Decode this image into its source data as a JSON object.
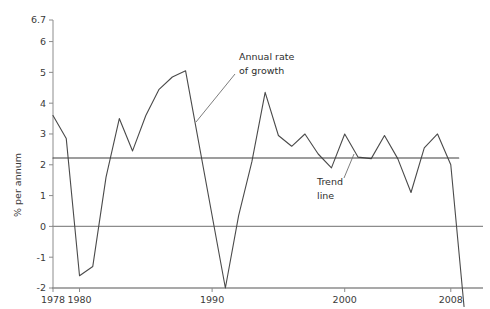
{
  "chart_data": {
    "type": "line",
    "title": "",
    "xlabel": "",
    "ylabel": "% per annum",
    "xlim": [
      1978,
      2009.6
    ],
    "ylim": [
      -2,
      6.7
    ],
    "grid": false,
    "legend_position": "none",
    "x_ticks": [
      "1978",
      "1980",
      "1990",
      "2000",
      "2008"
    ],
    "x_tick_values": [
      1978,
      1980,
      1990,
      2000,
      2008
    ],
    "y_ticks": [
      "-2",
      "-1",
      "0",
      "1",
      "2",
      "3",
      "4",
      "5",
      "6",
      "6.7"
    ],
    "y_tick_values": [
      -2,
      -1,
      0,
      1,
      2,
      3,
      4,
      5,
      6,
      6.7
    ],
    "reference_lines": [
      {
        "name": "zero-line",
        "value": 0,
        "color": "#8c8c8c"
      },
      {
        "name": "axis-baseline",
        "value": -2,
        "color": "#8c8c8c"
      }
    ],
    "series": [
      {
        "name": "Annual rate of growth",
        "color": "#4a4a4a",
        "x": [
          1978,
          1979,
          1980,
          1981,
          1982,
          1983,
          1984,
          1985,
          1986,
          1987,
          1988,
          1991,
          1992,
          1993,
          1994,
          1995,
          1996,
          1997,
          1998,
          1999,
          2000,
          2001,
          2002,
          2003,
          2004,
          2005,
          2006,
          2007,
          2008,
          2009
        ],
        "values": [
          3.6,
          2.85,
          -1.6,
          -1.3,
          1.6,
          3.5,
          2.45,
          3.6,
          4.45,
          4.85,
          5.05,
          -2.0,
          0.35,
          2.1,
          4.35,
          2.95,
          2.6,
          3.0,
          2.35,
          1.9,
          3.0,
          2.25,
          2.2,
          2.95,
          2.2,
          1.1,
          2.55,
          3.0,
          2.0,
          -2.6
        ]
      },
      {
        "name": "Trend line",
        "color": "#3c3c3c",
        "x": [
          1978,
          2008.6
        ],
        "values": [
          2.22,
          2.22
        ]
      }
    ],
    "annotations": [
      {
        "name": "annual-rate-of-growth-label",
        "text_lines": [
          "Annual rate",
          "of growth"
        ],
        "text_x": 239,
        "text_y": 60,
        "leader": {
          "x1": 235,
          "y1": 74,
          "x2": 196,
          "y2": 122
        }
      },
      {
        "name": "trend-line-label",
        "text_lines": [
          "Trend",
          "line"
        ],
        "text_x": 317,
        "text_y": 185,
        "leader": {
          "x1": 344,
          "y1": 178,
          "x2": 354,
          "y2": 154
        }
      }
    ]
  }
}
